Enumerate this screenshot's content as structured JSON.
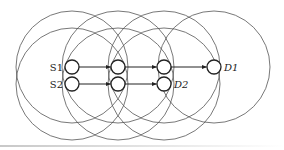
{
  "diagram": {
    "type": "wireless-multihop-network",
    "range_radius": 56,
    "node_radius": 7,
    "colors": {
      "line": "#222222",
      "range": "#555555",
      "background": "#ffffff"
    },
    "nodes": [
      {
        "id": "S1",
        "label": "S1",
        "x": 72,
        "y": 67,
        "label_side": "left",
        "italic": false
      },
      {
        "id": "S2",
        "label": "S2",
        "x": 72,
        "y": 84,
        "label_side": "left",
        "italic": false
      },
      {
        "id": "A1",
        "label": "",
        "x": 118,
        "y": 67
      },
      {
        "id": "A2",
        "label": "",
        "x": 118,
        "y": 84
      },
      {
        "id": "B1",
        "label": "",
        "x": 164,
        "y": 67
      },
      {
        "id": "D2",
        "label": "D2",
        "x": 164,
        "y": 84,
        "label_side": "right",
        "italic": true
      },
      {
        "id": "D1",
        "label": "D1",
        "x": 214,
        "y": 67,
        "label_side": "right",
        "italic": true
      }
    ],
    "edges": [
      {
        "from": "S1",
        "to": "A1"
      },
      {
        "from": "A1",
        "to": "B1"
      },
      {
        "from": "B1",
        "to": "D1"
      },
      {
        "from": "S2",
        "to": "A2"
      },
      {
        "from": "A2",
        "to": "D2"
      }
    ],
    "range_circles": [
      {
        "cx": 72,
        "cy": 67
      },
      {
        "cx": 118,
        "cy": 67
      },
      {
        "cx": 164,
        "cy": 67
      },
      {
        "cx": 214,
        "cy": 67
      },
      {
        "cx": 72,
        "cy": 84
      },
      {
        "cx": 118,
        "cy": 84
      },
      {
        "cx": 164,
        "cy": 84
      }
    ]
  }
}
